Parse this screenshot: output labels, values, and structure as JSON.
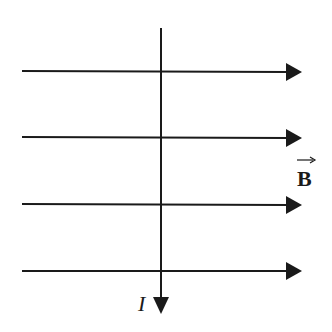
{
  "diagram": {
    "field": {
      "label": "B",
      "vector_arrow": "→",
      "direction": "right",
      "line_count": 4
    },
    "wire": {
      "current_label": "I",
      "direction": "down"
    },
    "colors": {
      "line": "#1a1a1a",
      "background": "#ffffff"
    }
  }
}
